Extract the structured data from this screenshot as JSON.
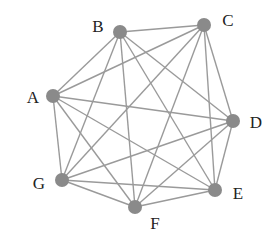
{
  "diagram": {
    "type": "complete-graph",
    "name": "K7",
    "colors": {
      "node": "#8a8a8a",
      "edge": "#9a9a9a",
      "label": "#222222"
    },
    "nodes": [
      {
        "id": "A",
        "label": "A",
        "x": 53,
        "y": 96,
        "lx": 33,
        "ly": 97
      },
      {
        "id": "B",
        "label": "B",
        "x": 120,
        "y": 32,
        "lx": 98,
        "ly": 26
      },
      {
        "id": "C",
        "label": "C",
        "x": 204,
        "y": 25,
        "lx": 228,
        "ly": 20
      },
      {
        "id": "D",
        "label": "D",
        "x": 233,
        "y": 121,
        "lx": 256,
        "ly": 122
      },
      {
        "id": "E",
        "label": "E",
        "x": 215,
        "y": 190,
        "lx": 238,
        "ly": 193
      },
      {
        "id": "F",
        "label": "F",
        "x": 135,
        "y": 207,
        "lx": 155,
        "ly": 223
      },
      {
        "id": "G",
        "label": "G",
        "x": 62,
        "y": 180,
        "lx": 39,
        "ly": 183
      }
    ],
    "edges": [
      [
        "A",
        "B"
      ],
      [
        "A",
        "C"
      ],
      [
        "A",
        "D"
      ],
      [
        "A",
        "E"
      ],
      [
        "A",
        "F"
      ],
      [
        "A",
        "G"
      ],
      [
        "B",
        "C"
      ],
      [
        "B",
        "D"
      ],
      [
        "B",
        "E"
      ],
      [
        "B",
        "F"
      ],
      [
        "B",
        "G"
      ],
      [
        "C",
        "D"
      ],
      [
        "C",
        "E"
      ],
      [
        "C",
        "F"
      ],
      [
        "C",
        "G"
      ],
      [
        "D",
        "E"
      ],
      [
        "D",
        "F"
      ],
      [
        "D",
        "G"
      ],
      [
        "E",
        "F"
      ],
      [
        "E",
        "G"
      ],
      [
        "F",
        "G"
      ]
    ]
  }
}
